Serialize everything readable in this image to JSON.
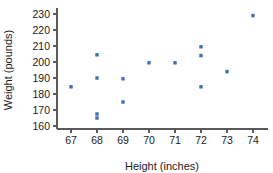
{
  "chart_data": {
    "type": "scatter",
    "title": "",
    "xlabel": "Height (inches)",
    "ylabel": "Weight (pounds)",
    "xlim": [
      66.4,
      74.6
    ],
    "ylim": [
      158.5,
      232
    ],
    "xticks": [
      67,
      68,
      69,
      70,
      71,
      72,
      73,
      74
    ],
    "yticks": [
      160,
      170,
      180,
      190,
      200,
      210,
      220,
      230
    ],
    "xtick_labels": [
      "67",
      "68",
      "69",
      "70",
      "71",
      "72",
      "73",
      "74"
    ],
    "ytick_labels": [
      "160",
      "170",
      "180",
      "190",
      "200",
      "210",
      "220",
      "230"
    ],
    "grid": false,
    "legend": false,
    "marker": "square",
    "marker_color": "#3d6fb5",
    "marker_size": 3.4,
    "axis_color": "#5a5a5a",
    "background": "#ffffff",
    "points": [
      {
        "x": 67,
        "y": 184.5
      },
      {
        "x": 68,
        "y": 204.5
      },
      {
        "x": 68,
        "y": 190.0
      },
      {
        "x": 68,
        "y": 167.5
      },
      {
        "x": 68,
        "y": 165.0
      },
      {
        "x": 69,
        "y": 189.5
      },
      {
        "x": 69,
        "y": 175.0
      },
      {
        "x": 70,
        "y": 199.5
      },
      {
        "x": 71,
        "y": 199.5
      },
      {
        "x": 72,
        "y": 209.5
      },
      {
        "x": 72,
        "y": 204.0
      },
      {
        "x": 72,
        "y": 184.5
      },
      {
        "x": 73,
        "y": 194.0
      },
      {
        "x": 74,
        "y": 229.0
      }
    ],
    "x_values": [
      67,
      68,
      68,
      68,
      68,
      69,
      69,
      70,
      71,
      72,
      72,
      72,
      73,
      74
    ],
    "y_values": [
      184.5,
      204.5,
      190.0,
      167.5,
      165.0,
      189.5,
      175.0,
      199.5,
      199.5,
      209.5,
      204.0,
      184.5,
      194.0,
      229.0
    ]
  }
}
